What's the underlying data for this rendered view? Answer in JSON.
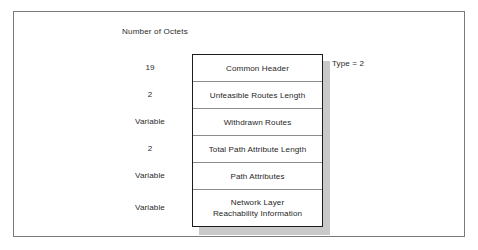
{
  "figure": {
    "octets_caption": "Number of Octets",
    "type_annotation": "Type = 2",
    "accent_color": "#1c1c1c",
    "shadow_color": "#c9c9c9",
    "frame_color": "#7b7b7d"
  },
  "fields": [
    {
      "size": "19",
      "label": "Common Header",
      "height": 27
    },
    {
      "size": "2",
      "label": "Unfeasible Routes  Length",
      "height": 27
    },
    {
      "size": "Variable",
      "label": "Withdrawn Routes",
      "height": 27
    },
    {
      "size": "2",
      "label": "Total Path Attribute Length",
      "height": 27
    },
    {
      "size": "Variable",
      "label": "Path Attributes",
      "height": 27
    },
    {
      "size": "Variable",
      "label": "Network Layer\nReachability Information",
      "height": 36
    }
  ]
}
